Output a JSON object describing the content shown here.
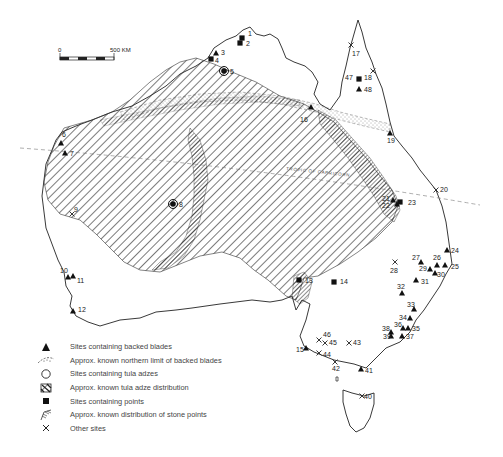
{
  "map": {
    "scale_bar": {
      "start_label": "0",
      "end_label": "500 KM"
    },
    "tropic_label": "TROPIC OF CAPRICORN",
    "sites": [
      {
        "id": "1",
        "type": "point",
        "x": 242,
        "y": 38,
        "lx": 248,
        "ly": 36
      },
      {
        "id": "2",
        "type": "point",
        "x": 240,
        "y": 43,
        "lx": 246,
        "ly": 46
      },
      {
        "id": "3",
        "type": "blade",
        "x": 216,
        "y": 53,
        "lx": 221,
        "ly": 55
      },
      {
        "id": "4",
        "type": "point",
        "x": 211,
        "y": 59,
        "lx": 215,
        "ly": 63
      },
      {
        "id": "5",
        "type": "tula",
        "x": 224,
        "y": 71,
        "lx": 230,
        "ly": 74
      },
      {
        "id": "6",
        "type": "blade",
        "x": 61,
        "y": 143,
        "lx": 62,
        "ly": 137
      },
      {
        "id": "7",
        "type": "blade",
        "x": 65,
        "y": 153,
        "lx": 70,
        "ly": 156
      },
      {
        "id": "8",
        "type": "tula",
        "x": 173,
        "y": 204,
        "lx": 179,
        "ly": 207
      },
      {
        "id": "9",
        "type": "other",
        "x": 72,
        "y": 214,
        "lx": 74,
        "ly": 212
      },
      {
        "id": "10",
        "type": "blade",
        "x": 68,
        "y": 277,
        "lx": 60,
        "ly": 273
      },
      {
        "id": "11",
        "type": "blade",
        "x": 73,
        "y": 276,
        "lx": 77,
        "ly": 283
      },
      {
        "id": "12",
        "type": "blade",
        "x": 73,
        "y": 311,
        "lx": 78,
        "ly": 312
      },
      {
        "id": "13",
        "type": "point",
        "x": 299,
        "y": 280,
        "lx": 305,
        "ly": 283
      },
      {
        "id": "14",
        "type": "point",
        "x": 334,
        "y": 282,
        "lx": 340,
        "ly": 284
      },
      {
        "id": "15",
        "type": "blade",
        "x": 306,
        "y": 348,
        "lx": 296,
        "ly": 352
      },
      {
        "id": "16",
        "type": "blade",
        "x": 311,
        "y": 107,
        "lx": 300,
        "ly": 122
      },
      {
        "id": "17",
        "type": "other",
        "x": 351,
        "y": 45,
        "lx": 352,
        "ly": 56
      },
      {
        "id": "18",
        "type": "other",
        "x": 373,
        "y": 71,
        "lx": 364,
        "ly": 80
      },
      {
        "id": "19",
        "type": "blade",
        "x": 390,
        "y": 133,
        "lx": 387,
        "ly": 143
      },
      {
        "id": "20",
        "type": "other",
        "x": 436,
        "y": 190,
        "lx": 440,
        "ly": 192
      },
      {
        "id": "21",
        "type": "blade",
        "x": 393,
        "y": 200,
        "lx": 382,
        "ly": 201
      },
      {
        "id": "22",
        "type": "blade",
        "x": 397,
        "y": 204,
        "lx": 382,
        "ly": 208
      },
      {
        "id": "23",
        "type": "point",
        "x": 400,
        "y": 202,
        "lx": 408,
        "ly": 205
      },
      {
        "id": "24",
        "type": "blade",
        "x": 447,
        "y": 250,
        "lx": 451,
        "ly": 253
      },
      {
        "id": "25",
        "type": "blade",
        "x": 445,
        "y": 265,
        "lx": 451,
        "ly": 269
      },
      {
        "id": "26",
        "type": "blade",
        "x": 437,
        "y": 265,
        "lx": 433,
        "ly": 260
      },
      {
        "id": "27",
        "type": "blade",
        "x": 421,
        "y": 262,
        "lx": 412,
        "ly": 260
      },
      {
        "id": "28",
        "type": "other",
        "x": 395,
        "y": 262,
        "lx": 390,
        "ly": 273
      },
      {
        "id": "29",
        "type": "blade",
        "x": 430,
        "y": 269,
        "lx": 419,
        "ly": 271
      },
      {
        "id": "30",
        "type": "blade",
        "x": 435,
        "y": 273,
        "lx": 437,
        "ly": 277
      },
      {
        "id": "31",
        "type": "blade",
        "x": 416,
        "y": 280,
        "lx": 421,
        "ly": 284
      },
      {
        "id": "32",
        "type": "blade",
        "x": 402,
        "y": 293,
        "lx": 397,
        "ly": 289
      },
      {
        "id": "33",
        "type": "blade",
        "x": 414,
        "y": 309,
        "lx": 407,
        "ly": 307
      },
      {
        "id": "34",
        "type": "blade",
        "x": 410,
        "y": 318,
        "lx": 399,
        "ly": 320
      },
      {
        "id": "35",
        "type": "blade",
        "x": 408,
        "y": 328,
        "lx": 412,
        "ly": 331
      },
      {
        "id": "36",
        "type": "blade",
        "x": 403,
        "y": 328,
        "lx": 394,
        "ly": 327
      },
      {
        "id": "37",
        "type": "blade",
        "x": 402,
        "y": 336,
        "lx": 406,
        "ly": 339
      },
      {
        "id": "38",
        "type": "blade",
        "x": 391,
        "y": 332,
        "lx": 382,
        "ly": 331
      },
      {
        "id": "39",
        "type": "blade",
        "x": 391,
        "y": 336,
        "lx": 383,
        "ly": 339
      },
      {
        "id": "40",
        "type": "other",
        "x": 362,
        "y": 396,
        "lx": 364,
        "ly": 399
      },
      {
        "id": "41",
        "type": "blade",
        "x": 361,
        "y": 369,
        "lx": 365,
        "ly": 373
      },
      {
        "id": "42",
        "type": "other",
        "x": 335,
        "y": 362,
        "lx": 332,
        "ly": 371
      },
      {
        "id": "43",
        "type": "other",
        "x": 349,
        "y": 343,
        "lx": 353,
        "ly": 345
      },
      {
        "id": "44",
        "type": "other",
        "x": 319,
        "y": 353,
        "lx": 323,
        "ly": 357
      },
      {
        "id": "45",
        "type": "other",
        "x": 325,
        "y": 343,
        "lx": 329,
        "ly": 345
      },
      {
        "id": "46",
        "type": "other",
        "x": 319,
        "y": 340,
        "lx": 323,
        "ly": 337
      },
      {
        "id": "47",
        "type": "point",
        "x": 359,
        "y": 79,
        "lx": 345,
        "ly": 80
      },
      {
        "id": "48",
        "type": "blade",
        "x": 359,
        "y": 89,
        "lx": 364,
        "ly": 92
      }
    ]
  },
  "legend": {
    "items": [
      {
        "icon": "filled-triangle",
        "label": "Sites containing backed blades"
      },
      {
        "icon": "stippled-band",
        "label": "Approx. known northern limit of backed blades"
      },
      {
        "icon": "open-circle",
        "label": "Sites containing tula adzes"
      },
      {
        "icon": "hatched-square",
        "label": "Approx. known tula adze distribution"
      },
      {
        "icon": "filled-square",
        "label": "Sites containing points"
      },
      {
        "icon": "dense-hatch-band",
        "label": "Approx. known distribution of stone points"
      },
      {
        "icon": "cross",
        "label": "Other sites"
      }
    ]
  },
  "colors": {
    "ink": "#1a1a1a",
    "hatch": "#333333",
    "background": "#ffffff"
  }
}
